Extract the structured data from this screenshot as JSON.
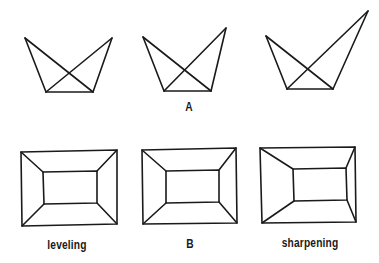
{
  "figure": {
    "top_row": {
      "label_center": "A",
      "shapes": [
        {
          "name": "bowtie-left",
          "top_left": [
            25,
            38
          ],
          "top_right": [
            112,
            38
          ],
          "bottom_left": [
            46,
            92
          ],
          "bottom_right": [
            93,
            92
          ]
        },
        {
          "name": "bowtie-center-A",
          "top_left": [
            143,
            37
          ],
          "top_right": [
            226,
            28
          ],
          "bottom_left": [
            164,
            91
          ],
          "bottom_right": [
            211,
            91
          ]
        },
        {
          "name": "bowtie-right",
          "top_left": [
            266,
            36
          ],
          "top_right": [
            368,
            11
          ],
          "bottom_left": [
            287,
            89
          ],
          "bottom_right": [
            333,
            89
          ]
        }
      ]
    },
    "bottom_row": {
      "labels": [
        "leveling",
        "B",
        "sharpening"
      ],
      "shapes": [
        {
          "name": "frame-leveling",
          "outer": [
            [
              21,
              152
            ],
            [
              117,
              150
            ],
            [
              117,
              224
            ],
            [
              22,
              226
            ]
          ],
          "inner": [
            [
              43,
              172
            ],
            [
              97,
              171
            ],
            [
              97,
              203
            ],
            [
              44,
              204
            ]
          ]
        },
        {
          "name": "frame-B",
          "outer": [
            [
              142,
              150
            ],
            [
              236,
              148
            ],
            [
              237,
              223
            ],
            [
              143,
              224
            ]
          ],
          "inner": [
            [
              166,
              171
            ],
            [
              219,
              170
            ],
            [
              219,
              202
            ],
            [
              166,
              203
            ]
          ]
        },
        {
          "name": "frame-sharpening",
          "outer": [
            [
              260,
              148
            ],
            [
              355,
              147
            ],
            [
              356,
              222
            ],
            [
              262,
              223
            ]
          ],
          "inner": [
            [
              293,
              169
            ],
            [
              346,
              168
            ],
            [
              347,
              200
            ],
            [
              294,
              201
            ]
          ]
        }
      ]
    },
    "labels": {
      "A": "A",
      "leveling": "leveling",
      "B": "B",
      "sharpening": "sharpening"
    }
  }
}
